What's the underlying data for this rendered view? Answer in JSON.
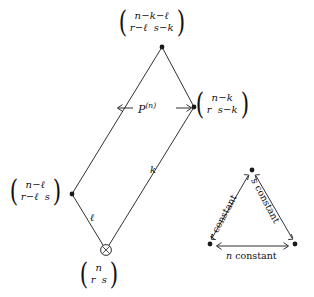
{
  "figure": {
    "type": "lattice-diagram",
    "background": "#ffffff",
    "ink": "#1a1a1a"
  },
  "nodes": {
    "top": {
      "name": "matrix-top",
      "row1": [
        "n−k−ℓ"
      ],
      "row2": [
        "r−ℓ",
        "s−k"
      ]
    },
    "right": {
      "name": "matrix-right",
      "row1": [
        "n−k"
      ],
      "row2": [
        "r",
        "s−k"
      ]
    },
    "left": {
      "name": "matrix-left",
      "row1": [
        "n−ℓ"
      ],
      "row2": [
        "r−ℓ",
        "s"
      ]
    },
    "bottom": {
      "name": "matrix-bottom",
      "row1": [
        "n"
      ],
      "row2": [
        "r",
        "s"
      ],
      "marker": "⊗"
    }
  },
  "edge_labels": {
    "ell": "ℓ",
    "k": "k"
  },
  "arrows": {
    "pn": {
      "base": "P",
      "superscript": "(n)"
    }
  },
  "legend": {
    "name": "constant-direction-triangle",
    "left_edge": "r constant",
    "left_edge_italic": "r",
    "left_edge_rest": " constant",
    "right_edge": "s constant",
    "right_edge_italic": "s",
    "right_edge_rest": " constant",
    "bottom_edge": "n constant",
    "bottom_edge_italic": "n",
    "bottom_edge_rest": " constant"
  }
}
